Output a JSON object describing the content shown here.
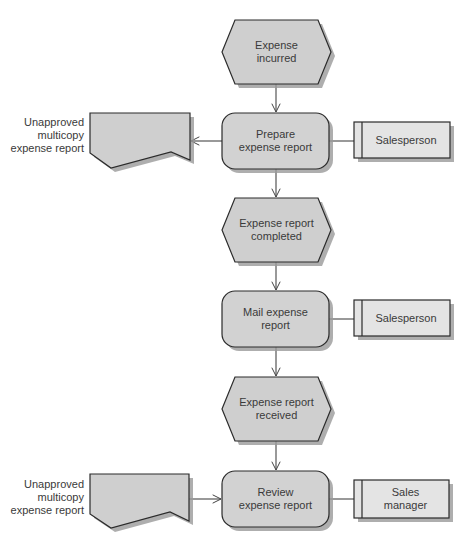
{
  "diagram": {
    "type": "event-driven process chain",
    "colors": {
      "shape_fill": "#cfcfcf",
      "role_fill": "#e4e4e4",
      "stroke": "#2b2b2b",
      "shadow": "#9a9a9a",
      "connector": "#555555"
    },
    "events": [
      {
        "id": "e1",
        "lines": [
          "Expense",
          "incurred"
        ]
      },
      {
        "id": "e2",
        "lines": [
          "Expense report",
          "completed"
        ]
      },
      {
        "id": "e3",
        "lines": [
          "Expense report",
          "received"
        ]
      }
    ],
    "functions": [
      {
        "id": "f1",
        "lines": [
          "Prepare",
          "expense report"
        ]
      },
      {
        "id": "f2",
        "lines": [
          "Mail expense",
          "report"
        ]
      },
      {
        "id": "f3",
        "lines": [
          "Review",
          "expense report"
        ]
      }
    ],
    "roles": [
      {
        "id": "r1",
        "lines": [
          "Salesperson"
        ],
        "attached_to": "f1"
      },
      {
        "id": "r2",
        "lines": [
          "Salesperson"
        ],
        "attached_to": "f2"
      },
      {
        "id": "r3",
        "lines": [
          "Sales",
          "manager"
        ],
        "attached_to": "f3"
      }
    ],
    "documents": [
      {
        "id": "d1",
        "lines": [
          "Unapproved",
          "multicopy",
          "expense report"
        ],
        "direction": "output from Prepare expense report"
      },
      {
        "id": "d2",
        "lines": [
          "Unapproved",
          "multicopy",
          "expense report"
        ],
        "direction": "input to Review expense report"
      }
    ],
    "flow": [
      "Expense incurred",
      "Prepare expense report",
      "Expense report completed",
      "Mail expense report",
      "Expense report received",
      "Review expense report"
    ]
  }
}
